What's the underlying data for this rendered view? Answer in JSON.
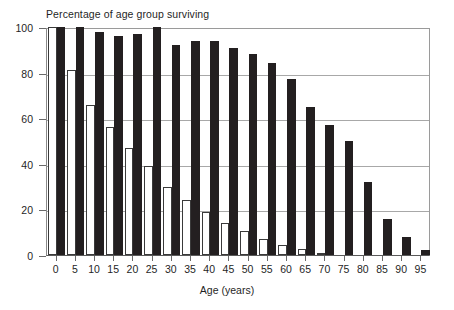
{
  "chart_data": {
    "type": "bar",
    "title": "Percentage of age group surviving",
    "xlabel": "Age (years)",
    "ylabel": "",
    "ylim": [
      0,
      100
    ],
    "yticks": [
      0,
      20,
      40,
      60,
      80,
      100
    ],
    "grid": true,
    "legend": "none",
    "categories": [
      "0",
      "5",
      "10",
      "15",
      "20",
      "25",
      "30",
      "35",
      "40",
      "45",
      "50",
      "55",
      "60",
      "65",
      "70",
      "75",
      "80",
      "85",
      "90",
      "95"
    ],
    "series": [
      {
        "name": "light",
        "style": "white-bar",
        "color": "#ffffff",
        "edge_color": "#3a3a3a",
        "values": [
          100,
          81,
          66,
          56,
          47,
          39,
          30,
          24,
          19,
          14,
          10.5,
          7,
          4.5,
          2.5,
          1,
          0,
          0,
          0,
          0,
          0
        ]
      },
      {
        "name": "dark",
        "style": "black-bar",
        "color": "#231f20",
        "edge_color": "#231f20",
        "values": [
          100,
          100,
          98,
          96,
          97,
          100,
          92,
          94,
          94,
          91,
          88,
          84,
          77,
          65,
          57,
          50,
          32,
          16,
          8,
          2
        ]
      }
    ]
  },
  "axis": {
    "y_tick_labels": [
      "0",
      "20",
      "40",
      "60",
      "80",
      "100"
    ],
    "x_tick_labels": [
      "0",
      "5",
      "10",
      "15",
      "20",
      "25",
      "30",
      "35",
      "40",
      "45",
      "50",
      "55",
      "60",
      "65",
      "70",
      "75",
      "80",
      "85",
      "90",
      "95"
    ]
  },
  "colors": {
    "light_fill": "#ffffff",
    "light_edge": "#3a3a3a",
    "dark_fill": "#231f20",
    "grid": "#a8a8a8",
    "frame": "#9a9a9a",
    "text": "#1f1f1f"
  }
}
